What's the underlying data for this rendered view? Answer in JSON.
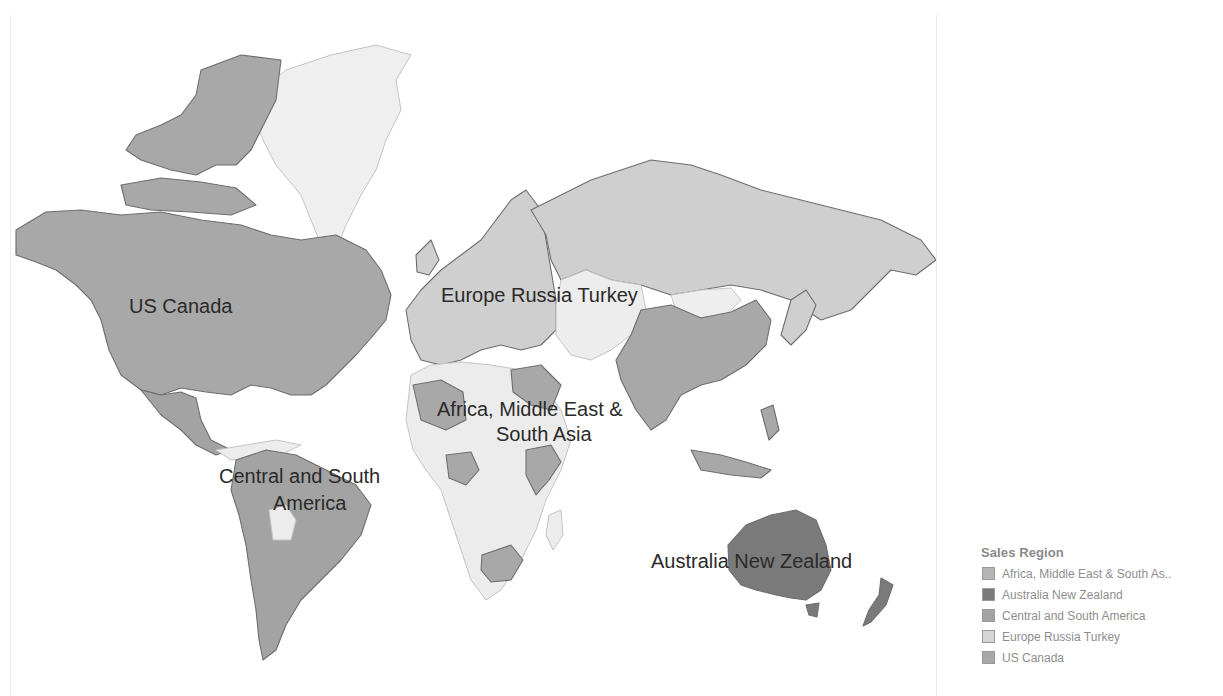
{
  "map": {
    "labels": [
      {
        "id": "us-canada",
        "text": "US Canada",
        "x": 128,
        "y": 295
      },
      {
        "id": "europe-russia-turkey",
        "text": "Europe Russia Turkey",
        "x": 440,
        "y": 284
      },
      {
        "id": "africa-me-sa-line1",
        "text": "Africa, Middle East &",
        "x": 436,
        "y": 398
      },
      {
        "id": "africa-me-sa-line2",
        "text": "South Asia",
        "x": 495,
        "y": 423
      },
      {
        "id": "central-south-line1",
        "text": "Central and South",
        "x": 218,
        "y": 465
      },
      {
        "id": "central-south-line2",
        "text": "America",
        "x": 272,
        "y": 492
      },
      {
        "id": "australia-nz",
        "text": "Australia New Zealand",
        "x": 650,
        "y": 550
      }
    ],
    "region_colors": {
      "africa_me_sa": "#b5b5b5",
      "australia_nz": "#7a7a7a",
      "central_south_america": "#a3a3a3",
      "europe_russia_turkey": "#cfcfcf",
      "us_canada": "#a8a8a8",
      "unassigned": "#ededed"
    }
  },
  "legend": {
    "title": "Sales Region",
    "items": [
      {
        "label": "Africa, Middle East & South As..",
        "color": "#b5b5b5"
      },
      {
        "label": "Australia New Zealand",
        "color": "#7a7a7a"
      },
      {
        "label": "Central and South America",
        "color": "#a3a3a3"
      },
      {
        "label": "Europe Russia Turkey",
        "color": "#d6d6d6"
      },
      {
        "label": "US Canada",
        "color": "#a8a8a8"
      }
    ]
  }
}
